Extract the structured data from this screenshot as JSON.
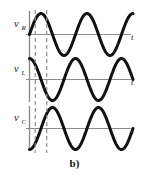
{
  "caption": "b)",
  "chart_data": {
    "type": "line",
    "title": "",
    "subtitle": "",
    "xlabel": "t",
    "ylabel": "",
    "grid": false,
    "legend": "none",
    "annotations": [
      "b)"
    ],
    "x": [
      0,
      0.0625,
      0.125,
      0.1875,
      0.25,
      0.3125,
      0.375,
      0.4375,
      0.5,
      0.5625,
      0.625,
      0.6875,
      0.75,
      0.8125,
      0.875,
      0.9375,
      1,
      1.0625,
      1.125,
      1.1875,
      1.25,
      1.3125,
      1.375,
      1.4375,
      1.5,
      1.5625,
      1.625,
      1.6875,
      1.75,
      1.8125,
      1.875,
      1.9375,
      2,
      2.0625,
      2.125,
      2.1875,
      2.25
    ],
    "x_unit": "periods",
    "xlim": [
      0,
      2.25
    ],
    "ylim": [
      -1.2,
      1.2
    ],
    "reference_lines": {
      "orientation": "vertical",
      "style": "dashed",
      "x_positions": [
        0.125,
        0.375
      ],
      "label": "phase reference markers"
    },
    "series": [
      {
        "name": "v_R",
        "label_base": "v",
        "label_sub": "R",
        "axis_label": "t",
        "waveform": "sine",
        "amplitude": 1.0,
        "phase_deg": 0,
        "periods": 2.25,
        "description": "resistor voltage, in phase with current",
        "values": [
          0,
          0.383,
          0.707,
          0.924,
          1,
          0.924,
          0.707,
          0.383,
          0,
          -0.383,
          -0.707,
          -0.924,
          -1,
          -0.924,
          -0.707,
          -0.383,
          0,
          0.383,
          0.707,
          0.924,
          1,
          0.924,
          0.707,
          0.383,
          0,
          -0.383,
          -0.707,
          -0.924,
          -1,
          -0.924,
          -0.707,
          -0.383,
          0,
          0.383,
          0.707,
          0.924,
          1
        ]
      },
      {
        "name": "v_L",
        "label_base": "v",
        "label_sub": "L",
        "axis_label": "t",
        "waveform": "sine",
        "amplitude": 1.0,
        "phase_deg": 90,
        "periods": 2.25,
        "description": "inductor voltage, leads current by 90 degrees",
        "values": [
          1,
          0.924,
          0.707,
          0.383,
          0,
          -0.383,
          -0.707,
          -0.924,
          -1,
          -0.924,
          -0.707,
          -0.383,
          0,
          0.383,
          0.707,
          0.924,
          1,
          0.924,
          0.707,
          0.383,
          0,
          -0.383,
          -0.707,
          -0.924,
          -1,
          -0.924,
          -0.707,
          -0.383,
          0,
          0.383,
          0.707,
          0.924,
          1,
          0.924,
          0.707,
          0.383,
          0
        ]
      },
      {
        "name": "v_C",
        "label_base": "v",
        "label_sub": "C",
        "axis_label": "t",
        "waveform": "sine",
        "amplitude": 1.0,
        "phase_deg": -90,
        "periods": 2.25,
        "description": "capacitor voltage, lags current by 90 degrees",
        "values": [
          -1,
          -0.924,
          -0.707,
          -0.383,
          0,
          0.383,
          0.707,
          0.924,
          1,
          0.924,
          0.707,
          0.383,
          0,
          -0.383,
          -0.707,
          -0.924,
          -1,
          -0.924,
          -0.707,
          -0.383,
          0,
          0.383,
          0.707,
          0.924,
          1,
          0.924,
          0.707,
          0.383,
          0,
          -0.383,
          -0.707,
          -0.924,
          -1,
          -0.924,
          -0.707,
          -0.383,
          0
        ]
      }
    ],
    "colors": {
      "wave": "#111111",
      "axis": "#8c8c8c",
      "dashed": "#8e8e8e",
      "background": "#ffffff",
      "text": "#1a1a1a"
    }
  }
}
